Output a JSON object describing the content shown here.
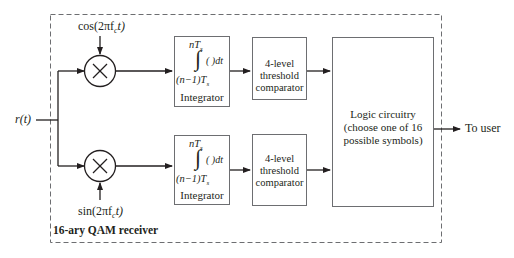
{
  "diagram": {
    "title": "16-ary QAM receiver",
    "input": {
      "label": "r(t)"
    },
    "output": {
      "label": "To user"
    },
    "branches": [
      {
        "id": "in-phase",
        "carrier": {
          "label": "cos(2πf",
          "sub": "c",
          "tail": "t)"
        },
        "multiplier_symbol": "×",
        "integrator": {
          "upper_limit": "nT",
          "upper_sub": "s",
          "integral_symbol": "∫",
          "integrand": "( )dt",
          "lower_limit": "(n−1)T",
          "lower_sub": "s",
          "name": "Integrator"
        },
        "comparator": {
          "lines": [
            "4-level",
            "threshold",
            "comparator"
          ]
        }
      },
      {
        "id": "quadrature",
        "carrier": {
          "label": "sin(2πf",
          "sub": "c",
          "tail": "t)"
        },
        "multiplier_symbol": "×",
        "integrator": {
          "upper_limit": "nT",
          "upper_sub": "s",
          "integral_symbol": "∫",
          "integrand": "( )dt",
          "lower_limit": "(n−1)T",
          "lower_sub": "s",
          "name": "Integrator"
        },
        "comparator": {
          "lines": [
            "4-level",
            "threshold",
            "comparator"
          ]
        }
      }
    ],
    "logic": {
      "lines": [
        "Logic circuitry",
        "(choose one of 16",
        "possible symbols)"
      ]
    }
  },
  "colors": {
    "line": "#231f20",
    "box_border": "#6d6e71",
    "dashed_border": "#6d6e71"
  }
}
